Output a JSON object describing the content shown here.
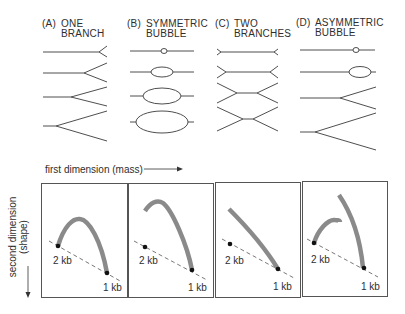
{
  "top_row": {
    "columns": [
      {
        "tag": "(A)",
        "title_line1": "ONE",
        "title_line2": "BRANCH",
        "kind": "one-branch"
      },
      {
        "tag": "(B)",
        "title_line1": "SYMMETRIC",
        "title_line2": "BUBBLE",
        "kind": "symmetric-bubble"
      },
      {
        "tag": "(C)",
        "title_line1": "TWO",
        "title_line2": "BRANCHES",
        "kind": "two-branches"
      },
      {
        "tag": "(D)",
        "title_line1": "ASYMMETRIC",
        "title_line2": "BUBBLE",
        "kind": "asymmetric-bubble"
      }
    ]
  },
  "bottom_row": {
    "x_axis_label": "first dimension (mass)",
    "y_axis_label_line1": "second dimension",
    "y_axis_label_line2": "(shape)",
    "panels": [
      {
        "label_2kb": "2 kb",
        "label_1kb": "1 kb",
        "pattern": "full arc (one branch)"
      },
      {
        "label_2kb": "2 kb",
        "label_1kb": "1 kb",
        "pattern": "partial arc (symmetric bubble)"
      },
      {
        "label_2kb": "2 kb",
        "label_1kb": "1 kb",
        "pattern": "straight diagonal (two branches)"
      },
      {
        "label_2kb": "2 kb",
        "label_1kb": "1 kb",
        "pattern": "broken arc (asymmetric bubble)"
      }
    ]
  },
  "colors": {
    "line": "#3a3a3a",
    "arc": "#8a8a8a",
    "dot": "#111111",
    "border": "#555555"
  }
}
